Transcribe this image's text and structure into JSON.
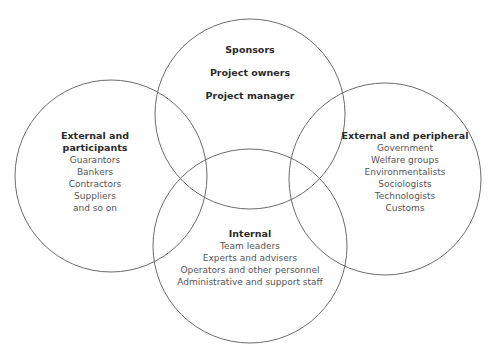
{
  "diagram": {
    "type": "venn",
    "stroke_color": "#6b6b6b",
    "circles": [
      {
        "id": "top",
        "cx": 250,
        "cy": 114,
        "r": 95
      },
      {
        "id": "left",
        "cx": 111,
        "cy": 176,
        "r": 96
      },
      {
        "id": "right",
        "cx": 385,
        "cy": 179,
        "r": 96
      },
      {
        "id": "bottom",
        "cx": 250,
        "cy": 246,
        "r": 97
      }
    ],
    "groups": {
      "top": {
        "headings": [
          "Sponsors",
          "Project owners",
          "Project manager"
        ]
      },
      "left": {
        "heading_line1": "External and",
        "heading_line2": "participants",
        "items": [
          "Guarantors",
          "Bankers",
          "Contractors",
          "Suppliers",
          "and so on"
        ]
      },
      "right": {
        "heading": "External and peripheral",
        "items": [
          "Government",
          "Welfare groups",
          "Environmentalists",
          "Sociologists",
          "Technologists",
          "Customs"
        ]
      },
      "bottom": {
        "heading": "Internal",
        "items": [
          "Team leaders",
          "Experts and advisers",
          "Operators and other personnel",
          "Administrative and support staff"
        ]
      }
    }
  }
}
